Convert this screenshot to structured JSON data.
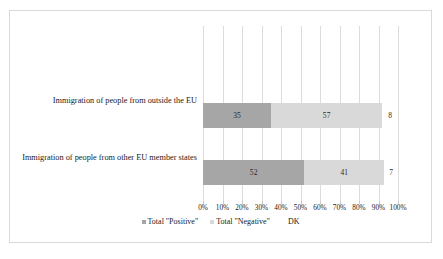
{
  "chart_data": {
    "type": "bar",
    "orientation": "horizontal",
    "stacked": true,
    "title": "",
    "xlabel": "",
    "ylabel": "",
    "xlim": [
      0,
      100
    ],
    "grid": true,
    "legend_position": "bottom",
    "categories": [
      "Immigration of people from outside the EU",
      "Immigration of people from other EU member states"
    ],
    "series": [
      {
        "name": "Total \"Positive\"",
        "color": "#a6a6a6",
        "values": [
          35,
          52
        ]
      },
      {
        "name": "Total \"Negative\"",
        "color": "#d9d9d9",
        "values": [
          57,
          41
        ]
      },
      {
        "name": "DK",
        "color": "#ffffff",
        "values": [
          8,
          7
        ]
      }
    ],
    "tick_labels": [
      "0%",
      "10%",
      "20%",
      "30%",
      "40%",
      "50%",
      "60%",
      "70%",
      "80%",
      "90%",
      "100%"
    ],
    "tick_values": [
      0,
      10,
      20,
      30,
      40,
      50,
      60,
      70,
      80,
      90,
      100
    ],
    "bar_labels": [
      [
        "35",
        "57",
        "8"
      ],
      [
        "52",
        "41",
        "7"
      ]
    ]
  },
  "legend": {
    "items": [
      {
        "label": "Total \"Positive\""
      },
      {
        "label": "Total \"Negative\""
      },
      {
        "label": "DK"
      }
    ]
  },
  "colors": {
    "positive": "#a6a6a6",
    "negative": "#d9d9d9",
    "dk": "#ffffff",
    "gridline": "#dcdcdc",
    "frame": "#d9d9d9"
  }
}
